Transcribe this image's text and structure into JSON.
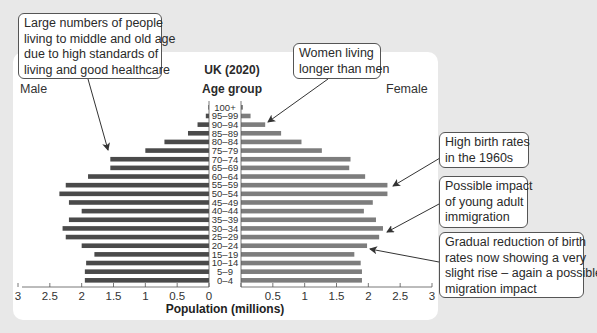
{
  "chart_data": {
    "type": "bar",
    "subtype": "population-pyramid",
    "title": "UK (2020)",
    "category_axis_title": "Age group",
    "xlabel": "Population (millions)",
    "xlim": [
      0,
      3
    ],
    "x_ticks": [
      "3",
      "2.5",
      "2",
      "1.5",
      "1",
      "0.5",
      "0",
      "0.5",
      "1",
      "1.5",
      "2",
      "2.5",
      "3"
    ],
    "categories": [
      "100+",
      "95–99",
      "90–94",
      "85–89",
      "80–84",
      "75–79",
      "70–74",
      "65–69",
      "60–64",
      "55–59",
      "50–54",
      "45–49",
      "40–44",
      "35–39",
      "30–34",
      "25–29",
      "20–24",
      "15–19",
      "10–14",
      "5–9",
      "0–4"
    ],
    "series": [
      {
        "name": "Male",
        "color": "#4a4a4a",
        "values": [
          0.01,
          0.05,
          0.18,
          0.33,
          0.7,
          1.0,
          1.55,
          1.55,
          1.9,
          2.25,
          2.35,
          2.2,
          2.0,
          2.2,
          2.3,
          2.25,
          2.0,
          1.8,
          1.93,
          1.95,
          1.95
        ]
      },
      {
        "name": "Female",
        "color": "#7d7d7d",
        "values": [
          0.03,
          0.15,
          0.38,
          0.63,
          0.95,
          1.27,
          1.72,
          1.7,
          1.95,
          2.3,
          2.3,
          2.07,
          1.93,
          2.12,
          2.23,
          2.17,
          1.98,
          1.78,
          1.88,
          1.9,
          1.9
        ]
      }
    ],
    "legend": {
      "left": "Male",
      "right": "Female"
    },
    "annotations": [
      {
        "id": "old-age",
        "text": [
          "Large numbers of people",
          "living to middle and old age",
          "due to high standards of",
          "living and good healthcare"
        ],
        "points_to": "70–74 (Male)"
      },
      {
        "id": "women-longer",
        "text": [
          "Women living",
          "longer than men"
        ],
        "points_to": "90–94 (Female)"
      },
      {
        "id": "birth-1960s",
        "text": [
          "High birth rates",
          "in the 1960s"
        ],
        "points_to": "55–59 (Female)"
      },
      {
        "id": "immigration",
        "text": [
          "Possible impact",
          "of young adult",
          "immigration"
        ],
        "points_to": "30–34 (Female)"
      },
      {
        "id": "birth-reduction",
        "text": [
          "Gradual reduction of birth",
          "rates now showing a very",
          "slight rise – again a possible",
          "migration impact"
        ],
        "points_to": "20–24 (Female)"
      }
    ],
    "grid": false
  },
  "labels": {
    "title": "UK (2020)",
    "age_group": "Age group",
    "male": "Male",
    "female": "Female",
    "axis_title": "Population (millions)"
  },
  "colors": {
    "background": "#e8e8e8",
    "panel": "#ffffff",
    "male_bar": "#4a4a4a",
    "female_bar": "#7d7d7d",
    "arrow": "#333333"
  }
}
